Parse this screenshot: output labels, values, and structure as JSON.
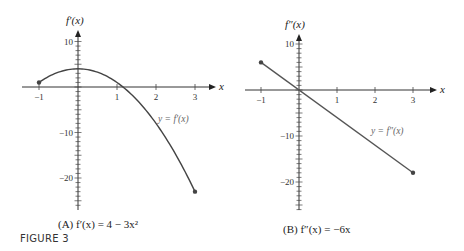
{
  "figure_label": "FIGURE 3",
  "chart_data": [
    {
      "type": "line",
      "panel": "A",
      "caption": "(A) f′(x) = 4 − 3x²",
      "ylabel": "f′(x)",
      "xlabel": "x",
      "curve_label": "y = f′(x)",
      "function": "4 - 3x^2",
      "xlim": [
        -1,
        3
      ],
      "ylim": [
        -25,
        12
      ],
      "x_ticks": [
        -1,
        1,
        2,
        3
      ],
      "y_tick_labels": [
        10,
        -10,
        -20
      ],
      "endpoints": [
        {
          "x": -1,
          "y": 1
        },
        {
          "x": 3,
          "y": -23
        }
      ],
      "points": [
        {
          "x": -1,
          "y": 1
        },
        {
          "x": -0.5,
          "y": 3.25
        },
        {
          "x": 0,
          "y": 4
        },
        {
          "x": 0.5,
          "y": 3.25
        },
        {
          "x": 1,
          "y": 1
        },
        {
          "x": 1.5,
          "y": -2.75
        },
        {
          "x": 2,
          "y": -8
        },
        {
          "x": 2.5,
          "y": -14.75
        },
        {
          "x": 3,
          "y": -23
        }
      ],
      "grid": false
    },
    {
      "type": "line",
      "panel": "B",
      "caption": "(B) f″(x) = −6x",
      "ylabel": "f″(x)",
      "xlabel": "x",
      "curve_label": "y = f″(x)",
      "function": "-6x",
      "xlim": [
        -1,
        3
      ],
      "ylim": [
        -25,
        12
      ],
      "x_ticks": [
        -1,
        1,
        2,
        3
      ],
      "y_tick_labels": [
        10,
        -10,
        -20
      ],
      "endpoints": [
        {
          "x": -1,
          "y": 6
        },
        {
          "x": 3,
          "y": -18
        }
      ],
      "points": [
        {
          "x": -1,
          "y": 6
        },
        {
          "x": 3,
          "y": -18
        }
      ],
      "grid": false
    }
  ]
}
